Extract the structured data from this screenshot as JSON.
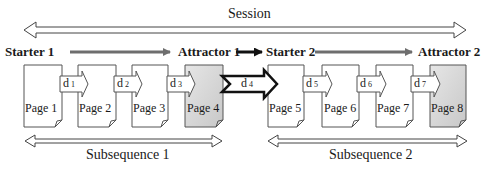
{
  "session": {
    "label": "Session"
  },
  "flow": {
    "starter1": "Starter 1",
    "attractor1": "Attractor 1",
    "starter2": "Starter 2",
    "attractor2": "Attractor 2"
  },
  "pages": [
    {
      "label": "Page 1",
      "shaded": false
    },
    {
      "label": "Page 2",
      "shaded": false
    },
    {
      "label": "Page 3",
      "shaded": false
    },
    {
      "label": "Page 4",
      "shaded": true
    },
    {
      "label": "Page 5",
      "shaded": false
    },
    {
      "label": "Page 6",
      "shaded": false
    },
    {
      "label": "Page 7",
      "shaded": false
    },
    {
      "label": "Page 8",
      "shaded": true
    }
  ],
  "transitions": [
    {
      "base": "d",
      "sub": "1"
    },
    {
      "base": "d",
      "sub": "2"
    },
    {
      "base": "d",
      "sub": "3"
    },
    {
      "base": "d",
      "sub": "4"
    },
    {
      "base": "d",
      "sub": "5"
    },
    {
      "base": "d",
      "sub": "6"
    },
    {
      "base": "d",
      "sub": "7"
    }
  ],
  "subsequences": [
    {
      "label": "Subsequence 1"
    },
    {
      "label": "Subsequence 2"
    }
  ],
  "colors": {
    "line": "#333333",
    "gray_arrow": "#6e6e6e",
    "page_shade": "#d9d9d9",
    "page_fill": "#ffffff"
  }
}
